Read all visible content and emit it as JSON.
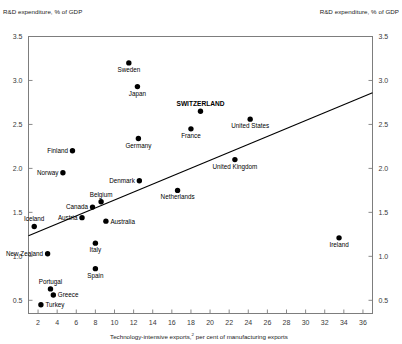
{
  "chart_data": {
    "type": "scatter",
    "title": "",
    "ylabel_left": "R&D expenditure, % of GDP",
    "ylabel_right": "R&D expenditure, % of GDP",
    "xlabel": "Technology-intensive exports, per cent of manufacturing exports",
    "xlabel_footnote": "2",
    "xlim": [
      1,
      37
    ],
    "ylim": [
      0.35,
      3.5
    ],
    "xticks": [
      2,
      4,
      6,
      8,
      10,
      12,
      14,
      16,
      18,
      20,
      22,
      24,
      26,
      28,
      30,
      32,
      34,
      36
    ],
    "yticks": [
      0.5,
      1.0,
      1.5,
      2.0,
      2.5,
      3.0,
      3.5
    ],
    "ytick_labels": [
      "0.5",
      "1.0",
      "1.5",
      "2.0",
      "2.5",
      "3.0",
      "3.5"
    ],
    "xtick_labels": [
      "2",
      "4",
      "6",
      "8",
      "10",
      "12",
      "14",
      "16",
      "18",
      "20",
      "22",
      "24",
      "26",
      "28",
      "30",
      "32",
      "34",
      "36"
    ],
    "grid": false,
    "legend": "none",
    "highlight_color": "#000000",
    "marker_color": "#000000",
    "trendline": {
      "label": "linear fit",
      "x_start": 1.0,
      "y_start": 1.235,
      "x_end": 37.0,
      "y_end": 2.86
    },
    "points": [
      {
        "name": "Sweden",
        "x": 11.5,
        "y": 3.2,
        "label_pos": "below",
        "bold": false
      },
      {
        "name": "Japan",
        "x": 12.4,
        "y": 2.93,
        "label_pos": "below",
        "bold": false
      },
      {
        "name": "SWITZERLAND",
        "x": 19.0,
        "y": 2.65,
        "label_pos": "above",
        "bold": true
      },
      {
        "name": "United States",
        "x": 24.2,
        "y": 2.56,
        "label_pos": "below",
        "bold": false
      },
      {
        "name": "France",
        "x": 18.0,
        "y": 2.45,
        "label_pos": "below",
        "bold": false
      },
      {
        "name": "Germany",
        "x": 12.5,
        "y": 2.34,
        "label_pos": "below",
        "bold": false
      },
      {
        "name": "Finland",
        "x": 5.6,
        "y": 2.2,
        "label_pos": "left",
        "bold": false
      },
      {
        "name": "United Kingdom",
        "x": 22.6,
        "y": 2.1,
        "label_pos": "below",
        "bold": false
      },
      {
        "name": "Norway",
        "x": 4.6,
        "y": 1.95,
        "label_pos": "left",
        "bold": false
      },
      {
        "name": "Denmark",
        "x": 12.6,
        "y": 1.86,
        "label_pos": "left",
        "bold": false
      },
      {
        "name": "Netherlands",
        "x": 16.6,
        "y": 1.75,
        "label_pos": "below",
        "bold": false
      },
      {
        "name": "Belgium",
        "x": 8.6,
        "y": 1.62,
        "label_pos": "above",
        "bold": false
      },
      {
        "name": "Canada",
        "x": 7.7,
        "y": 1.56,
        "label_pos": "left",
        "bold": false
      },
      {
        "name": "Austria",
        "x": 6.6,
        "y": 1.44,
        "label_pos": "left",
        "bold": false
      },
      {
        "name": "Australia",
        "x": 9.1,
        "y": 1.4,
        "label_pos": "right",
        "bold": false
      },
      {
        "name": "Iceland",
        "x": 1.6,
        "y": 1.34,
        "label_pos": "above",
        "bold": false
      },
      {
        "name": "Ireland",
        "x": 33.5,
        "y": 1.21,
        "label_pos": "below",
        "bold": false
      },
      {
        "name": "Italy",
        "x": 8.0,
        "y": 1.15,
        "label_pos": "below",
        "bold": false
      },
      {
        "name": "New Zealand",
        "x": 3.0,
        "y": 1.03,
        "label_pos": "left",
        "bold": false
      },
      {
        "name": "Spain",
        "x": 8.0,
        "y": 0.86,
        "label_pos": "below",
        "bold": false
      },
      {
        "name": "Portugal",
        "x": 3.3,
        "y": 0.63,
        "label_pos": "above",
        "bold": false
      },
      {
        "name": "Greece",
        "x": 3.6,
        "y": 0.56,
        "label_pos": "right",
        "bold": false
      },
      {
        "name": "Turkey",
        "x": 2.3,
        "y": 0.45,
        "label_pos": "right",
        "bold": false
      }
    ]
  }
}
